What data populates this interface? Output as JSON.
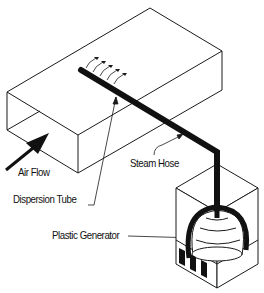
{
  "diagram": {
    "type": "humidifier-system-schematic",
    "colors": {
      "line": "#1a1a1a",
      "background": "#ffffff"
    },
    "labels": {
      "air_flow": "Air Flow",
      "steam_hose": "Steam Hose",
      "dispersion_tube": "Dispersion Tube",
      "plastic_generator": "Plastic Generator"
    },
    "components": [
      {
        "id": "duct",
        "name": "Air duct"
      },
      {
        "id": "dispersion_tube",
        "name": "Dispersion Tube"
      },
      {
        "id": "steam_hose",
        "name": "Steam Hose"
      },
      {
        "id": "generator_cabinet",
        "name": "Plastic Generator cabinet"
      }
    ]
  }
}
